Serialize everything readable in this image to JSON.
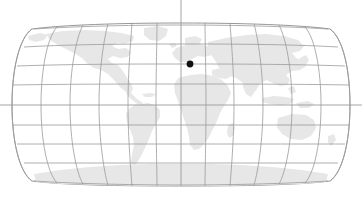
{
  "map": {
    "title": "World Map",
    "projection": "robinson",
    "background_color": "#ffffff",
    "land_color": "#e7e7e7",
    "graticule_color": "#9a9a9a",
    "outline_color": "#8a8a8a",
    "marker_color": "#111111",
    "width": 362,
    "height": 199,
    "bounds": {
      "left": 12,
      "right": 350,
      "top": 23,
      "bottom": 186
    },
    "center_meridian_x": 181,
    "equator_y": 105,
    "graticule": {
      "parallel_step_degrees": 20,
      "meridian_step_degrees": 30,
      "parallel_latitudes": [
        80,
        60,
        40,
        20,
        0,
        -20,
        -40,
        -60,
        -80
      ],
      "meridian_longitudes": [
        -180,
        -150,
        -120,
        -90,
        -60,
        -30,
        0,
        30,
        60,
        90,
        120,
        150,
        180
      ],
      "parallel_y_positions": [
        25,
        45,
        65,
        85,
        105,
        125,
        145,
        165,
        185
      ],
      "show_grid": true
    },
    "axis_lines": {
      "central_meridian_extends_above": true,
      "equator_extends_beyond_edges": true
    },
    "marker": {
      "label": "location-marker",
      "x": 190,
      "y": 64,
      "radius": 3.4,
      "visible": true
    },
    "landmasses": [
      "north-america",
      "greenland",
      "south-america",
      "africa",
      "europe",
      "asia",
      "australia",
      "antarctica",
      "madagascar",
      "indonesia",
      "japan",
      "new-zealand",
      "british-isles",
      "iceland"
    ]
  }
}
